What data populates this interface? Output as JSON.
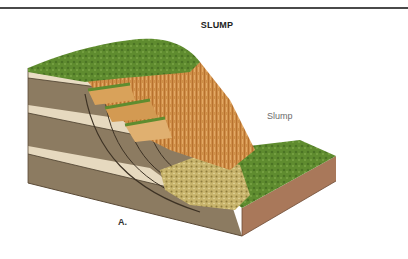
{
  "figure": {
    "title": "SLUMP",
    "panel_label": "A.",
    "annotations": [
      {
        "text": "Slump",
        "target": "slump-block"
      }
    ]
  },
  "colors": {
    "rule_line": "#4a4a4a",
    "grass": "#5e8a2e",
    "cliff_face": "#c98a45",
    "rock_layer": "#8b7a60",
    "light_stratum": "#e8dcc3",
    "debris": "#c9b56a",
    "side_face": "#a9785a"
  }
}
